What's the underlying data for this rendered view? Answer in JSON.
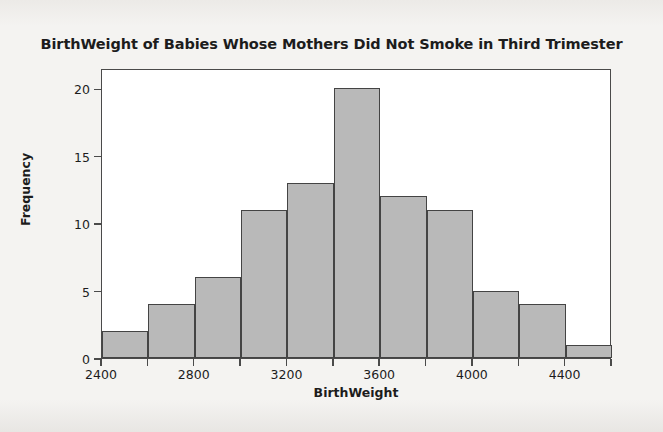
{
  "chart_data": {
    "type": "bar",
    "title": "BirthWeight of Babies Whose Mothers Did Not Smoke in Third Trimester",
    "xlabel": "BirthWeight",
    "ylabel": "Frequency",
    "bin_width": 200,
    "bin_edges": [
      2400,
      2600,
      2800,
      3000,
      3200,
      3400,
      3600,
      3800,
      4000,
      4200,
      4400,
      4600
    ],
    "categories": [
      "2400-2600",
      "2600-2800",
      "2800-3000",
      "3000-3200",
      "3200-3400",
      "3400-3600",
      "3600-3800",
      "3800-4000",
      "4000-4200",
      "4200-4400",
      "4400-4600"
    ],
    "values": [
      2,
      4,
      6,
      11,
      13,
      20,
      12,
      11,
      5,
      4,
      1
    ],
    "xlim": [
      2400,
      4600
    ],
    "ylim": [
      0,
      21.5
    ],
    "x_ticks": [
      2400,
      2600,
      2800,
      3000,
      3200,
      3400,
      3600,
      3800,
      4000,
      4200,
      4400,
      4600
    ],
    "x_tick_labels": [
      "2400",
      "",
      "2800",
      "",
      "3200",
      "",
      "3600",
      "",
      "4000",
      "",
      "4400",
      ""
    ],
    "y_ticks": [
      0,
      5,
      10,
      15,
      20
    ],
    "y_tick_labels": [
      "0",
      "5",
      "10",
      "15",
      "20"
    ],
    "grid": false,
    "legend": false,
    "bar_fill_color": "#b9b9b9",
    "bar_edge_color": "#444444",
    "frame_color": "#4a4a4a",
    "plot_background": "#ffffff",
    "figure_background": "#f3f2f0"
  }
}
